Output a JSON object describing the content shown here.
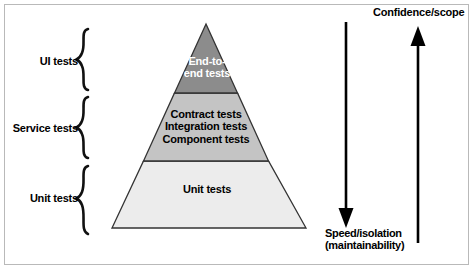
{
  "figure": {
    "background_color": "#ffffff",
    "frame_color": "#b9b9b9"
  },
  "pyramid": {
    "outline_color": "#333333",
    "tiers": [
      {
        "id": "end-to-end",
        "caption_line1": "End-to-",
        "caption_line2": "end tests",
        "fill": "#8c8c8c",
        "text_color": "#ffffff"
      },
      {
        "id": "service-level",
        "caption_line1": "Contract tests",
        "caption_line2": "Integration tests",
        "caption_line3": "Component tests",
        "fill": "#c4c4c4",
        "text_color": "#000000"
      },
      {
        "id": "unit",
        "caption_line1": "Unit tests",
        "fill": "#ececec",
        "text_color": "#000000"
      }
    ]
  },
  "brackets": [
    {
      "id": "ui",
      "label": "UI tests"
    },
    {
      "id": "service",
      "label": "Service tests"
    },
    {
      "id": "unit",
      "label": "Unit tests"
    }
  ],
  "axes": {
    "down_arrow": {
      "label_line1": "Speed/isolation",
      "label_line2": "(maintainability)",
      "direction": "down",
      "color": "#000000"
    },
    "up_arrow": {
      "label": "Confidence/scope",
      "direction": "up",
      "color": "#000000"
    }
  }
}
